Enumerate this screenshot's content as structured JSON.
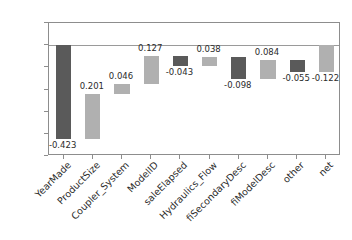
{
  "chart_data": {
    "type": "bar",
    "subtype": "waterfall",
    "title": "",
    "xlabel": "",
    "ylabel": "",
    "ylim": [
      -0.5,
      0.1
    ],
    "grid": false,
    "legend": null,
    "categories": [
      "YearMade",
      "ProductSize",
      "Coupler_System",
      "ModelID",
      "saleElapsed",
      "Hydraulics_Flow",
      "fiSecondaryDesc",
      "fiModelDesc",
      "other",
      "net"
    ],
    "values": [
      -0.423,
      0.201,
      0.046,
      0.127,
      -0.043,
      0.038,
      -0.098,
      0.084,
      -0.055,
      -0.122
    ],
    "value_labels": [
      "-0.423",
      "0.201",
      "0.046",
      "0.127",
      "-0.043",
      "0.038",
      "-0.098",
      "0.084",
      "-0.055",
      "-0.122"
    ],
    "bar_bottoms": [
      -0.423,
      -0.222,
      -0.176,
      -0.049,
      -0.092,
      -0.054,
      -0.152,
      -0.068,
      -0.123,
      -0.122
    ],
    "bar_tops": [
      0.0,
      -0.423,
      -0.222,
      -0.176,
      -0.049,
      -0.092,
      -0.054,
      -0.152,
      -0.068,
      0.0
    ],
    "is_total": [
      false,
      false,
      false,
      false,
      false,
      false,
      false,
      false,
      false,
      true
    ],
    "bar_colors": [
      "#5a5a5a",
      "#b0b0b0",
      "#b0b0b0",
      "#b0b0b0",
      "#5a5a5a",
      "#b0b0b0",
      "#5a5a5a",
      "#b0b0b0",
      "#5a5a5a",
      "#b0b0b0"
    ],
    "colors": {
      "decrease": "#5a5a5a",
      "increase": "#b0b0b0",
      "total": "#b0b0b0",
      "axis": "#8d8d8d",
      "text": "#2b2b2b",
      "background": "#ffffff"
    },
    "yticks": [
      0.1,
      0.0,
      -0.1,
      -0.2,
      -0.3,
      -0.4,
      -0.5
    ],
    "ytick_labels": [
      "0.100",
      "0.000",
      "-0.100",
      "-0.200",
      "-0.300",
      "-0.400",
      "-0.500"
    ]
  }
}
